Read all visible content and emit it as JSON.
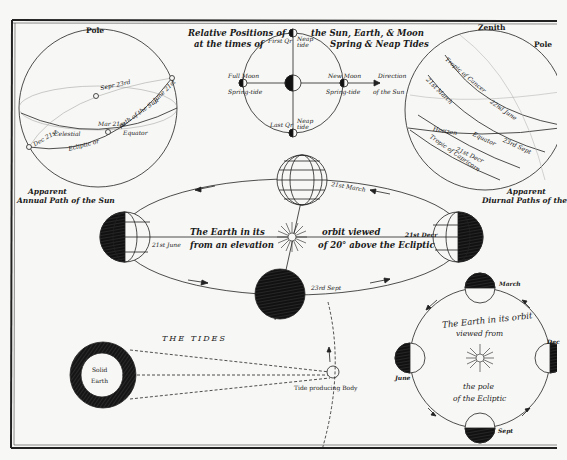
{
  "plate": {
    "background": "#f7f7f5",
    "ink": "#1a1a1a"
  },
  "sun_path_sphere": {
    "top_label": "Pole",
    "caption_line1": "Apparent",
    "caption_line2": "Annual Path of the Sun",
    "labels": {
      "sep": "Sepr 23rd",
      "june": "June 21st",
      "mar": "Mar 21st",
      "dec": "Dec 21st",
      "celestial": "Celestial",
      "equator": "Equator",
      "ecliptic": "Ecliptic or",
      "path_of_sun": "path of the Sun"
    }
  },
  "tides_positions": {
    "title_left1": "Relative Positions of",
    "title_left2": "at the times of",
    "title_right1": "the Sun, Earth, & Moon",
    "title_right2": "Spring & Neap Tides",
    "first_qr": "First Qr",
    "neap_tide": "Neap tide",
    "last_qr": "Last Qr",
    "full_moon": "Full Moon",
    "new_moon": "New Moon",
    "spring_tide": "Spring-tide",
    "direction": "Direction",
    "of_the_sun": "of the Sun"
  },
  "diurnal_sphere": {
    "top_label": "Zenith",
    "pole_label": "Pole",
    "caption_line1": "Apparent",
    "caption_line2": "Diurnal Paths of the",
    "labels": {
      "tropic_cancer": "Tropic of Cancer",
      "march": "21st March",
      "june": "22nd June",
      "horizon": "Horizon",
      "equator": "Equator",
      "sep": "23rd Sept",
      "dec": "21st Decr",
      "tropic_capricorn": "Tropic of Capricorn"
    }
  },
  "orbit_elevation": {
    "text_left1": "The Earth in its",
    "text_left2": "from an elevation",
    "text_right1": "orbit viewed",
    "text_right2": "of 20° above the Ecliptic",
    "march": "21st March",
    "june": "21st June",
    "dec": "21st Decr",
    "sep": "23rd Sept"
  },
  "tides": {
    "title": "THE TIDES",
    "earth_line1": "Solid",
    "earth_line2": "Earth",
    "body_label": "Tide producing Body"
  },
  "orbit_pole": {
    "text1": "The Earth in its orbit",
    "text2": "viewed from",
    "text3": "the pole",
    "text4": "of the Ecliptic",
    "march": "March",
    "june": "June",
    "sept": "Sept",
    "dec": "Dec"
  }
}
